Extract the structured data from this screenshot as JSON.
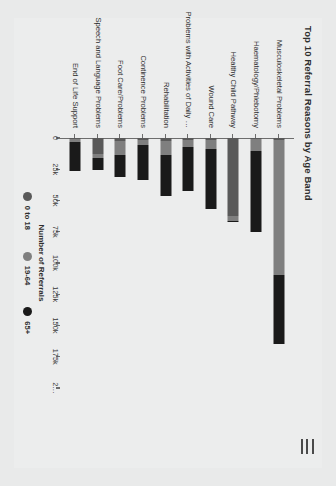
{
  "app": {
    "background_color": "#e9eaea",
    "card_color": "#eceded"
  },
  "header": {
    "menu_icon": "hamburger-icon",
    "title": "Top 10 Referral Reasons by Age Band"
  },
  "chart_data": {
    "type": "bar",
    "orientation": "horizontal",
    "stacked": true,
    "title": "Top 10 Referral Reasons by Age Band",
    "xlabel": "Number of Referrals",
    "ylabel": "",
    "xlim": [
      0,
      200000
    ],
    "grid": false,
    "legend_position": "bottom",
    "tick_labels": [
      "0",
      "25k",
      "50k",
      "75k",
      "100k",
      "125k",
      "150k",
      "175k",
      "2…"
    ],
    "tick_values": [
      0,
      25000,
      50000,
      75000,
      100000,
      125000,
      150000,
      175000,
      200000
    ],
    "categories": [
      "Musculoskeletal Problems",
      "Haematology/Phlebotomy",
      "Healthy Child Pathway",
      "Wound Care",
      "Problems with Activities of Daily …",
      "Rehabilitation",
      "Continence Problems",
      "Foot Care/Problems",
      "Speech and Language Problems",
      "End of Life Support"
    ],
    "series": [
      {
        "name": "0 to 18",
        "color": "#595959",
        "values": [
          1500,
          1000,
          62000,
          1500,
          1500,
          2500,
          1500,
          2000,
          12500,
          1000
        ]
      },
      {
        "name": "19-64",
        "color": "#7f7f7f",
        "values": [
          108000,
          9000,
          4000,
          7500,
          6000,
          11000,
          4000,
          11500,
          3500,
          2500
        ]
      },
      {
        "name": "65+",
        "color": "#1a1a1a",
        "values": [
          55000,
          65000,
          1500,
          47500,
          35000,
          33000,
          28000,
          17500,
          9500,
          23000
        ]
      }
    ],
    "bar_totals": [
      164500,
      75000,
      67500,
      56500,
      42500,
      46500,
      33500,
      31000,
      25500,
      26500
    ]
  },
  "legend": {
    "items": [
      {
        "label": "0 to 18",
        "color": "#595959"
      },
      {
        "label": "19-64",
        "color": "#7f7f7f"
      },
      {
        "label": "65+",
        "color": "#1a1a1a"
      }
    ]
  }
}
